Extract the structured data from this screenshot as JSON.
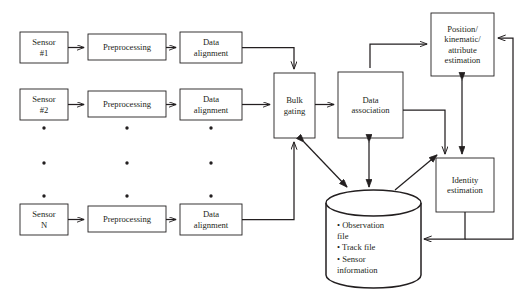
{
  "diagram": {
    "type": "block-flow-diagram",
    "background_color": "#ffffff",
    "stroke_color": "#231f20",
    "nodes": [
      {
        "id": "sensor1",
        "label": "Sensor\n#1",
        "shape": "rect",
        "x": 20,
        "y": 32,
        "w": 48,
        "h": 31
      },
      {
        "id": "prep1",
        "label": "Preprocessing",
        "shape": "rect",
        "x": 88,
        "y": 34,
        "w": 78,
        "h": 26
      },
      {
        "id": "align1",
        "label": "Data\nalignment",
        "shape": "rect",
        "x": 180,
        "y": 32,
        "w": 62,
        "h": 31
      },
      {
        "id": "sensor2",
        "label": "Sensor\n#2",
        "shape": "rect",
        "x": 20,
        "y": 89,
        "w": 48,
        "h": 31
      },
      {
        "id": "prep2",
        "label": "Preprocessing",
        "shape": "rect",
        "x": 88,
        "y": 91,
        "w": 78,
        "h": 26
      },
      {
        "id": "align2",
        "label": "Data\nalignment",
        "shape": "rect",
        "x": 180,
        "y": 89,
        "w": 62,
        "h": 31
      },
      {
        "id": "sensorN",
        "label": "Sensor\nN",
        "shape": "rect",
        "x": 20,
        "y": 204,
        "w": 48,
        "h": 31
      },
      {
        "id": "prepN",
        "label": "Preprocessing",
        "shape": "rect",
        "x": 88,
        "y": 206,
        "w": 78,
        "h": 26
      },
      {
        "id": "alignN",
        "label": "Data\nalignment",
        "shape": "rect",
        "x": 180,
        "y": 204,
        "w": 62,
        "h": 31
      },
      {
        "id": "bulk",
        "label": "Bulk\ngating",
        "shape": "rect",
        "x": 274,
        "y": 73,
        "w": 41,
        "h": 65
      },
      {
        "id": "assoc",
        "label": "Data\nassociation",
        "shape": "rect",
        "x": 338,
        "y": 72,
        "w": 65,
        "h": 66
      },
      {
        "id": "posest",
        "label": "Position/\nkinematic/\nattribute\nestimation",
        "shape": "rect",
        "x": 431,
        "y": 13,
        "w": 63,
        "h": 63
      },
      {
        "id": "identity",
        "label": "Identity\nestimation",
        "shape": "rect",
        "x": 436,
        "y": 158,
        "w": 58,
        "h": 54
      },
      {
        "id": "database",
        "label": "• Observation\n   file\n• Track file\n• Sensor\n   information",
        "shape": "cylinder",
        "x": 326,
        "y": 190,
        "w": 95,
        "h": 98
      }
    ],
    "database_items": [
      "Observation file",
      "Track file",
      "Sensor information"
    ],
    "vertical_ellipsis_columns": [
      44,
      127,
      211
    ],
    "vertical_ellipsis_rows": [
      128,
      163,
      196
    ],
    "edges": [
      {
        "from": "sensor1",
        "to": "prep1",
        "kind": "arrow"
      },
      {
        "from": "prep1",
        "to": "align1",
        "kind": "arrow"
      },
      {
        "from": "align1",
        "to": "bulk",
        "kind": "arrow",
        "route": "right-down"
      },
      {
        "from": "sensor2",
        "to": "prep2",
        "kind": "arrow"
      },
      {
        "from": "prep2",
        "to": "align2",
        "kind": "arrow"
      },
      {
        "from": "align2",
        "to": "bulk",
        "kind": "arrow",
        "route": "straight"
      },
      {
        "from": "sensorN",
        "to": "prepN",
        "kind": "arrow"
      },
      {
        "from": "prepN",
        "to": "alignN",
        "kind": "arrow"
      },
      {
        "from": "alignN",
        "to": "bulk",
        "kind": "arrow",
        "route": "right-up"
      },
      {
        "from": "bulk",
        "to": "assoc",
        "kind": "arrow"
      },
      {
        "from": "assoc",
        "to": "posest",
        "kind": "arrow",
        "route": "up-right"
      },
      {
        "from": "assoc",
        "to": "identity",
        "kind": "arrow",
        "route": "right-down"
      },
      {
        "from": "bulk",
        "to": "database",
        "kind": "double-arrow",
        "route": "diagonal"
      },
      {
        "from": "assoc",
        "to": "database",
        "kind": "double-arrow",
        "route": "vertical"
      },
      {
        "from": "database",
        "to": "identity",
        "kind": "arrow",
        "route": "diagonal-up"
      },
      {
        "from": "posest",
        "to": "identity",
        "kind": "double-arrow",
        "route": "vertical"
      },
      {
        "from": "identity",
        "to": "database",
        "kind": "arrow",
        "route": "down-left"
      },
      {
        "from": "database",
        "to": "posest",
        "kind": "arrow",
        "route": "outer-right-loop"
      }
    ]
  }
}
